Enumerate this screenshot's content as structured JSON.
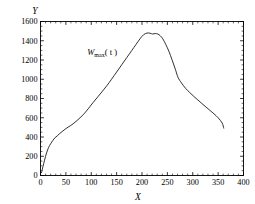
{
  "chart_data": {
    "type": "line",
    "title": "",
    "subtitle": "",
    "xlabel": "X",
    "ylabel": "Y",
    "xlim": [
      0,
      400
    ],
    "ylim": [
      0,
      1600
    ],
    "grid": false,
    "legend_position": "none",
    "background_color": "#ffffff",
    "line_color": "#1a1a1a",
    "axis_color": "#000000",
    "xticks": [
      0,
      50,
      100,
      150,
      200,
      250,
      300,
      350,
      400
    ],
    "xtick_labels": [
      "0",
      "50",
      "100",
      "150",
      "200",
      "250",
      "300",
      "350",
      "400"
    ],
    "x_minor_tick_step": 10,
    "yticks": [
      0,
      200,
      400,
      600,
      800,
      1000,
      1200,
      1400,
      1600
    ],
    "ytick_labels": [
      "0",
      "200",
      "400",
      "600",
      "800",
      "1000",
      "1200",
      "1400",
      "1600"
    ],
    "y_minor_tick_step": 50,
    "series": [
      {
        "name": "Wmax(t)",
        "label_text": "W",
        "label_subscript": "max",
        "label_suffix": "( t )",
        "label_x": 92,
        "label_y": 1255,
        "x": [
          2,
          5,
          8,
          12,
          16,
          20,
          24,
          28,
          33,
          38,
          44,
          50,
          56,
          62,
          70,
          78,
          86,
          95,
          104,
          113,
          122,
          131,
          140,
          150,
          160,
          170,
          180,
          188,
          196,
          203,
          210,
          216,
          221,
          226,
          231,
          236,
          241,
          247,
          253,
          259,
          265,
          271,
          278,
          286,
          294,
          302,
          310,
          318,
          326,
          334,
          342,
          350,
          358,
          361
        ],
        "y": [
          30,
          95,
          160,
          235,
          292,
          330,
          362,
          390,
          412,
          437,
          462,
          487,
          508,
          528,
          562,
          600,
          642,
          700,
          760,
          818,
          875,
          935,
          1000,
          1075,
          1150,
          1225,
          1300,
          1360,
          1420,
          1462,
          1480,
          1478,
          1470,
          1475,
          1470,
          1452,
          1420,
          1360,
          1290,
          1205,
          1115,
          1020,
          960,
          905,
          862,
          822,
          785,
          748,
          712,
          676,
          640,
          600,
          545,
          492
        ]
      }
    ]
  }
}
